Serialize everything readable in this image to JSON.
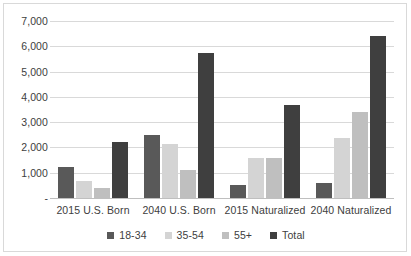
{
  "chart_data": {
    "type": "bar",
    "title": "",
    "xlabel": "",
    "ylabel": "",
    "ylim": [
      0,
      7000
    ],
    "ytick_step": 1000,
    "grid": true,
    "legend_position": "bottom",
    "categories": [
      "2015 U.S. Born",
      "2040 U.S. Born",
      "2015 Naturalized",
      "2040 Naturalized"
    ],
    "ytick_labels": [
      "7,000",
      "6,000",
      "5,000",
      "4,000",
      "3,000",
      "2,000",
      "1,000",
      "-"
    ],
    "ytick_values": [
      7000,
      6000,
      5000,
      4000,
      3000,
      2000,
      1000,
      0
    ],
    "series": [
      {
        "name": "18-34",
        "color": "#595959",
        "values": [
          1220,
          2480,
          510,
          610
        ]
      },
      {
        "name": "35-54",
        "color": "#d4d4d4",
        "values": [
          670,
          2150,
          1600,
          2390
        ]
      },
      {
        "name": "55+",
        "color": "#bfbfbf",
        "values": [
          390,
          1090,
          1600,
          3420
        ]
      },
      {
        "name": "Total",
        "color": "#3f3f3f",
        "values": [
          2210,
          5750,
          3690,
          6400
        ]
      }
    ]
  },
  "style": {
    "border_color": "#d9d9d9",
    "gridline_color": "#d9d9d9",
    "axis_color": "#bfbfbf",
    "text_color": "#404040",
    "background": "#ffffff"
  }
}
